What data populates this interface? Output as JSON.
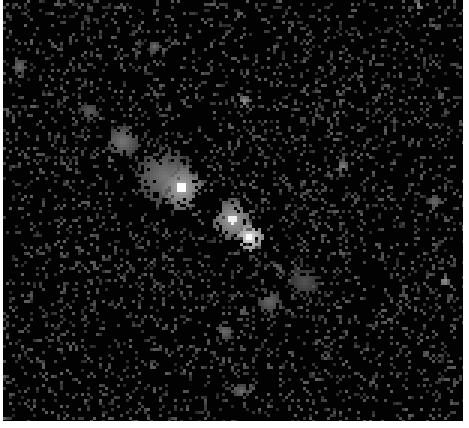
{
  "image": {
    "kind": "grayscale-noise-field",
    "width": 460,
    "height": 421,
    "background": "#020202",
    "border_color": "#ffffff",
    "pixel_block": 3,
    "noise": {
      "seed": 7,
      "density": 0.16,
      "min_level": 40,
      "max_level": 95
    },
    "blobs": [
      {
        "x": 177,
        "y": 186,
        "r": 14,
        "level": 175,
        "core": 255
      },
      {
        "x": 160,
        "y": 175,
        "r": 18,
        "level": 120
      },
      {
        "x": 118,
        "y": 140,
        "r": 10,
        "level": 120
      },
      {
        "x": 85,
        "y": 110,
        "r": 7,
        "level": 95
      },
      {
        "x": 228,
        "y": 218,
        "r": 13,
        "level": 165,
        "core": 240
      },
      {
        "x": 245,
        "y": 236,
        "r": 9,
        "level": 235,
        "core": 255
      },
      {
        "x": 265,
        "y": 300,
        "r": 8,
        "level": 105
      },
      {
        "x": 300,
        "y": 280,
        "r": 10,
        "level": 85
      },
      {
        "x": 220,
        "y": 330,
        "r": 6,
        "level": 110
      },
      {
        "x": 240,
        "y": 100,
        "r": 4,
        "level": 150
      },
      {
        "x": 338,
        "y": 165,
        "r": 4,
        "level": 135
      },
      {
        "x": 440,
        "y": 280,
        "r": 3,
        "level": 160
      },
      {
        "x": 430,
        "y": 200,
        "r": 5,
        "level": 110
      },
      {
        "x": 237,
        "y": 390,
        "r": 5,
        "level": 110
      },
      {
        "x": 15,
        "y": 65,
        "r": 5,
        "level": 110
      },
      {
        "x": 415,
        "y": 4,
        "r": 3,
        "level": 150
      },
      {
        "x": 150,
        "y": 45,
        "r": 4,
        "level": 110
      }
    ]
  }
}
